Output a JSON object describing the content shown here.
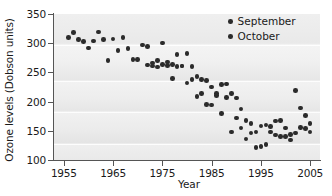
{
  "chart_data": {
    "type": "scatter",
    "title": "",
    "xlabel": "Year",
    "ylabel": "Ozone levels (Dobson units)",
    "xlim": [
      1953,
      2007
    ],
    "ylim": [
      100,
      350
    ],
    "xticks": [
      "1955",
      "1965",
      "1975",
      "1985",
      "1995",
      "2005"
    ],
    "xtick_values": [
      1955,
      1965,
      1975,
      1985,
      1995,
      2005
    ],
    "yticks": [
      "100",
      "150",
      "200",
      "250",
      "300",
      "350"
    ],
    "ytick_values": [
      100,
      150,
      200,
      250,
      300,
      350
    ],
    "grid": false,
    "legend_position": "top-right",
    "legend": [
      {
        "label": "September",
        "marker": "circle",
        "color": "#2b2b2b"
      },
      {
        "label": "October",
        "marker": "circle",
        "color": "#2b2b2b"
      }
    ],
    "series": [
      {
        "name": "September",
        "marker": "circle",
        "color": "#2b2b2b",
        "points": [
          [
            1956,
            310
          ],
          [
            1957,
            318
          ],
          [
            1958,
            306
          ],
          [
            1959,
            303
          ],
          [
            1960,
            292
          ],
          [
            1961,
            304
          ],
          [
            1962,
            319
          ],
          [
            1963,
            306
          ],
          [
            1964,
            270
          ],
          [
            1965,
            307
          ],
          [
            1966,
            287
          ],
          [
            1967,
            310
          ],
          [
            1968,
            291
          ],
          [
            1969,
            272
          ],
          [
            1970,
            272
          ],
          [
            1971,
            297
          ],
          [
            1972,
            294
          ],
          [
            1973,
            261
          ],
          [
            1974,
            259
          ],
          [
            1975,
            300
          ],
          [
            1976,
            268
          ],
          [
            1977,
            264
          ],
          [
            1978,
            281
          ],
          [
            1979,
            261
          ],
          [
            1980,
            282
          ],
          [
            1981,
            260
          ],
          [
            1982,
            243
          ],
          [
            1983,
            238
          ],
          [
            1984,
            236
          ],
          [
            1985,
            225
          ],
          [
            1986,
            214
          ],
          [
            1987,
            229
          ],
          [
            1988,
            230
          ],
          [
            1989,
            214
          ],
          [
            1990,
            206
          ],
          [
            1991,
            187
          ],
          [
            1992,
            168
          ],
          [
            1993,
            163
          ],
          [
            1994,
            148
          ],
          [
            1995,
            158
          ],
          [
            1996,
            160
          ],
          [
            1997,
            157
          ],
          [
            1998,
            167
          ],
          [
            1999,
            168
          ],
          [
            2000,
            155
          ],
          [
            2001,
            144
          ],
          [
            2002,
            219
          ],
          [
            2003,
            189
          ],
          [
            2004,
            176
          ],
          [
            2005,
            162
          ]
        ]
      },
      {
        "name": "October",
        "marker": "circle",
        "color": "#2b2b2b",
        "points": [
          [
            1972,
            263
          ],
          [
            1973,
            266
          ],
          [
            1974,
            270
          ],
          [
            1975,
            264
          ],
          [
            1976,
            262
          ],
          [
            1977,
            240
          ],
          [
            1978,
            260
          ],
          [
            1979,
            261
          ],
          [
            1980,
            232
          ],
          [
            1981,
            238
          ],
          [
            1982,
            209
          ],
          [
            1983,
            214
          ],
          [
            1984,
            195
          ],
          [
            1985,
            194
          ],
          [
            1986,
            210
          ],
          [
            1987,
            180
          ],
          [
            1988,
            207
          ],
          [
            1989,
            148
          ],
          [
            1990,
            172
          ],
          [
            1991,
            155
          ],
          [
            1992,
            136
          ],
          [
            1993,
            146
          ],
          [
            1994,
            121
          ],
          [
            1995,
            123
          ],
          [
            1996,
            127
          ],
          [
            1997,
            148
          ],
          [
            1998,
            143
          ],
          [
            1999,
            140
          ],
          [
            2000,
            140
          ],
          [
            2001,
            134
          ],
          [
            2002,
            146
          ],
          [
            2003,
            156
          ],
          [
            2004,
            154
          ],
          [
            2005,
            148
          ]
        ]
      }
    ]
  }
}
